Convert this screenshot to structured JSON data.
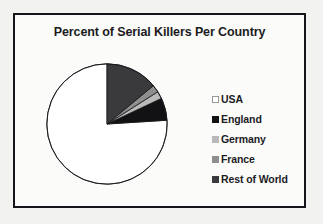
{
  "chart_data": {
    "type": "pie",
    "title": "Percent of Serial Killers Per Country",
    "categories": [
      "USA",
      "England",
      "Germany",
      "France",
      "Rest of World"
    ],
    "values": [
      76,
      6,
      2,
      2,
      14
    ],
    "colors": [
      "#ffffff",
      "#121214",
      "#b9b9b9",
      "#8e8e8e",
      "#3a3a3c"
    ],
    "slice_border_color": "#16161a",
    "start_angle_deg": 90,
    "direction": "counterclockwise",
    "legend_position": "right",
    "grid": false,
    "xlabel": "",
    "ylabel": ""
  },
  "frame": {
    "border_color": "#16161a",
    "background": "#fbfbfa"
  },
  "page": {
    "background": "#f2f2f0"
  }
}
